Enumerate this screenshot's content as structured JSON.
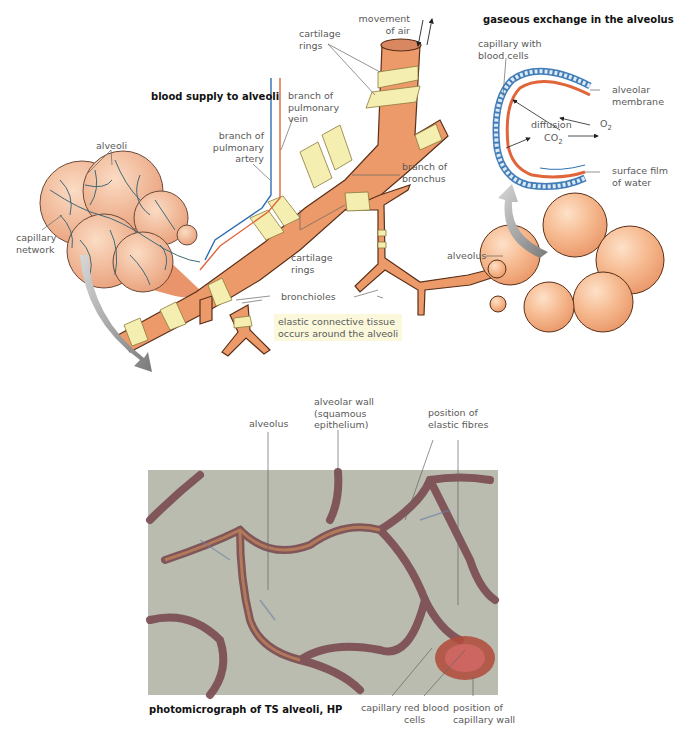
{
  "figure": {
    "colors": {
      "tissue": "#ec9a6a",
      "tissue_dark": "#d9804f",
      "cartilage": "#f4eeb0",
      "artery": "#2f6fb0",
      "vein": "#e0653a",
      "capillary_network": "#3f6a78",
      "photo_background": "#b9bcae",
      "outline": "#6b3a22"
    },
    "sections": {
      "blood_supply": {
        "title": "blood supply to alveoli",
        "labels": {
          "alveoli": "alveoli",
          "capillary_network_1": "capillary",
          "capillary_network_2": "network",
          "artery_1": "branch of",
          "artery_2": "pulmonary",
          "artery_3": "artery",
          "vein_1": "branch of",
          "vein_2": "pulmonary",
          "vein_3": "vein"
        }
      },
      "airways": {
        "labels": {
          "movement_1": "movement",
          "movement_2": "of air",
          "cartilage_top_1": "cartilage",
          "cartilage_top_2": "rings",
          "branch_bronchus_1": "branch of",
          "branch_bronchus_2": "bronchus",
          "cartilage_mid_1": "cartilage",
          "cartilage_mid_2": "rings",
          "bronchioles": "bronchioles",
          "alveolus": "alveolus"
        },
        "note_1": "elastic connective tissue",
        "note_2": "occurs around the alveoli"
      },
      "gas_exchange": {
        "title": "gaseous exchange in the alveolus",
        "labels": {
          "capillary_1": "capillary with",
          "capillary_2": "blood cells",
          "membrane_1": "alveolar",
          "membrane_2": "membrane",
          "diffusion": "diffusion",
          "o2": "O",
          "o2_sub": "2",
          "co2": "CO",
          "co2_sub": "2",
          "film_1": "surface film",
          "film_2": "of water"
        }
      },
      "photomicrograph": {
        "caption": "photomicrograph of  TS alveoli, HP",
        "labels": {
          "alveolus": "alveolus",
          "wall_1": "alveolar wall",
          "wall_2": "(squamous",
          "wall_3": "epithelium)",
          "elastic_1": "position of",
          "elastic_2": "elastic fibres",
          "capillary": "capillary",
          "rbc_1": "red blood",
          "rbc_2": "cells",
          "cap_wall_1": "position of",
          "cap_wall_2": "capillary wall"
        }
      }
    }
  }
}
